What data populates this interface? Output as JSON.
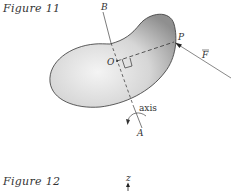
{
  "figures": [
    {
      "caption": "Figure 11",
      "labels": {
        "B": "B",
        "O": "O",
        "P": "P",
        "F": "F",
        "axis": "axis",
        "A": "A"
      }
    },
    {
      "caption": "Figure 12",
      "labels": {
        "z": "z"
      }
    }
  ],
  "colors": {
    "body_fill_light": "#f2f2f2",
    "body_fill_dark": "#9a9a9a",
    "outline": "#333333",
    "line": "#444444"
  }
}
